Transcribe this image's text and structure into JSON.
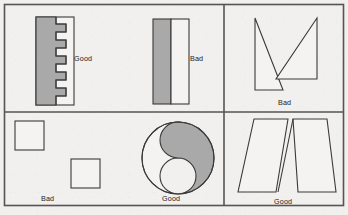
{
  "figure": {
    "background_color": "#f1f0ee",
    "frame_color": "#555555",
    "outline_color": "#3a3a3a",
    "fill_gray": "#a9a9a9",
    "fill_white": "#f4f3f1",
    "frame": {
      "x": 4,
      "y": 4,
      "width": 340,
      "height": 202
    },
    "dividers": {
      "vertical_x": 224,
      "horizontal_left_y": 112,
      "horizontal_right_y": 112
    }
  },
  "panels": [
    {
      "id": "comb-interlock",
      "name": "top-left-panel",
      "verdict": "Good",
      "label": "Good",
      "label_x": 74,
      "label_y": 55,
      "description": "Two interlocking comb shapes with five square teeth each, nested with no wasted space",
      "shapes": [
        {
          "role": "shaded-comb",
          "fill": "#a9a9a9",
          "teeth": 5
        },
        {
          "role": "clear-comb",
          "fill": "#f4f3f1",
          "teeth": 5
        }
      ],
      "bounds": {
        "x": 36,
        "y": 17,
        "width": 38,
        "height": 88
      }
    },
    {
      "id": "plain-rectangles",
      "name": "top-middle-panel",
      "verdict": "Bad",
      "label": "Bad",
      "label_x": 190,
      "label_y": 55,
      "description": "Two plain rectangles placed side by side leaving unusable offcut",
      "shapes": [
        {
          "role": "shaded-rectangle",
          "fill": "#a9a9a9"
        },
        {
          "role": "clear-rectangle",
          "fill": "#f4f3f1"
        }
      ],
      "bounds": {
        "x": 153,
        "y": 19,
        "width": 36,
        "height": 85
      }
    },
    {
      "id": "separated-squares",
      "name": "bottom-left-panel",
      "verdict": "Bad",
      "label": "Bad",
      "label_x": 41,
      "label_y": 195,
      "description": "Two squares scattered apart with large waste between them",
      "shapes": [
        {
          "role": "square-upper-left",
          "fill": "#f4f3f1"
        },
        {
          "role": "square-lower-right",
          "fill": "#f4f3f1"
        }
      ],
      "bounds": {
        "x": 15,
        "y": 120,
        "width": 85,
        "height": 75
      }
    },
    {
      "id": "yin-yang-circle",
      "name": "bottom-middle-panel",
      "verdict": "Good",
      "label": "Good",
      "label_x": 162,
      "label_y": 195,
      "description": "Circle split by an S-curve into two mating pieces, shaded piece right, clear piece left",
      "shapes": [
        {
          "role": "clear-half",
          "fill": "#f4f3f1"
        },
        {
          "role": "shaded-half",
          "fill": "#a9a9a9"
        }
      ],
      "bounds": {
        "x": 142,
        "y": 122,
        "width": 72,
        "height": 72
      }
    },
    {
      "id": "opposed-triangles",
      "name": "right-top-panel",
      "verdict": "Bad",
      "label": "Bad",
      "label_x": 278,
      "label_y": 99,
      "description": "Two narrow triangles meeting at a point, leaving large triangular scrap",
      "shapes": [
        {
          "role": "left-triangle",
          "fill": "#f4f3f1"
        },
        {
          "role": "right-triangle",
          "fill": "#f4f3f1"
        }
      ],
      "bounds": {
        "x": 254,
        "y": 18,
        "width": 64,
        "height": 72
      }
    },
    {
      "id": "inverted-trapezoids",
      "name": "right-bottom-panel",
      "verdict": "Good",
      "label": "Good",
      "label_x": 274,
      "label_y": 198,
      "description": "Two trapezoids alternately inverted so their slanted edges cross and interlock",
      "shapes": [
        {
          "role": "left-trapezoid",
          "fill": "#f4f3f1"
        },
        {
          "role": "right-trapezoid",
          "fill": "#f4f3f1"
        }
      ],
      "bounds": {
        "x": 238,
        "y": 118,
        "width": 98,
        "height": 75
      }
    }
  ]
}
